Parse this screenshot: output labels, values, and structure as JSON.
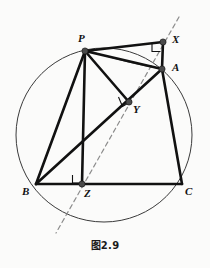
{
  "figure": {
    "caption": "图2.9",
    "background_color": "#fbfbfa",
    "stroke_color": "#111111",
    "circle_color": "#3a3a3a",
    "dashed_color": "#8c8c8c",
    "vertex_fill": "#4a4a4a"
  },
  "points": {
    "P": {
      "label": "P",
      "x": 85,
      "y": 51,
      "label_x": 78,
      "label_y": 36
    },
    "X": {
      "label": "X",
      "x": 163,
      "y": 42,
      "label_x": 172,
      "label_y": 37
    },
    "A": {
      "label": "A",
      "x": 162,
      "y": 69,
      "label_x": 172,
      "label_y": 64
    },
    "Y": {
      "label": "Y",
      "x": 129,
      "y": 102,
      "label_x": 133,
      "label_y": 106
    },
    "B": {
      "label": "B",
      "x": 36,
      "y": 184,
      "label_x": 25,
      "label_y": 189
    },
    "Z": {
      "label": "Z",
      "x": 82,
      "y": 184,
      "label_x": 85,
      "label_y": 189
    },
    "C": {
      "label": "C",
      "x": 182,
      "y": 184,
      "label_x": 186,
      "label_y": 189
    }
  },
  "circle": {
    "name": "circumcircle",
    "cx": 104,
    "cy": 135,
    "rx": 88,
    "ry": 87
  },
  "segments": [
    {
      "name": "segment-PX",
      "from": "P",
      "to": "X"
    },
    {
      "name": "segment-XA",
      "from": "X",
      "to": "A"
    },
    {
      "name": "segment-PA",
      "from": "P",
      "to": "A"
    },
    {
      "name": "segment-PY",
      "from": "P",
      "to": "Y"
    },
    {
      "name": "segment-PZ",
      "from": "P",
      "to": "Z"
    },
    {
      "name": "segment-PB",
      "from": "P",
      "to": "B"
    },
    {
      "name": "segment-BA",
      "from": "B",
      "to": "A"
    },
    {
      "name": "segment-BC",
      "from": "B",
      "to": "C"
    },
    {
      "name": "segment-AC",
      "from": "A",
      "to": "C"
    }
  ],
  "arc": {
    "name": "arc-PA",
    "description": "thin arc from P curving to A"
  },
  "dashed_line": {
    "name": "dashed-simson-line",
    "x1": 179,
    "y1": 17,
    "x2": 56,
    "y2": 233
  },
  "right_angles": [
    {
      "name": "right-angle-X",
      "at": "X"
    },
    {
      "name": "right-angle-Y",
      "at": "Y"
    },
    {
      "name": "right-angle-Z",
      "at": "Z"
    }
  ]
}
